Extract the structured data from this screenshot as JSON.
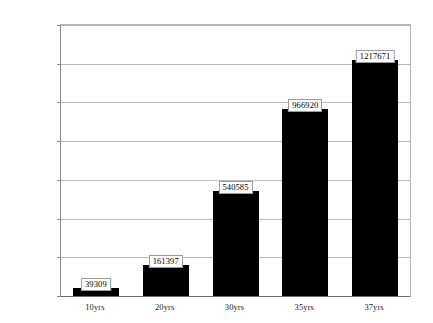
{
  "chart_data": {
    "type": "bar",
    "title": "",
    "subtitle": "",
    "xlabel": "",
    "ylabel": "",
    "categories": [
      "10yrs",
      "20yrs",
      "30yrs",
      "35yrs",
      "37yrs"
    ],
    "values": [
      39309,
      161397,
      540585,
      966920,
      1217671
    ],
    "data_labels": [
      "39309",
      "161397",
      "540585",
      "966920",
      "1217671"
    ],
    "ylim": [
      0,
      1400000
    ],
    "yticks": [
      0,
      200000,
      400000,
      600000,
      800000,
      1000000,
      1200000,
      1400000
    ],
    "ytick_labels": [
      "0",
      "200000",
      "400000",
      "600000",
      "800000",
      "1000000",
      "1200000",
      "1400000"
    ],
    "grid": true,
    "legend": false,
    "legend_position": "none",
    "series": [
      {
        "name": "",
        "values": [
          39309,
          161397,
          540585,
          966920,
          1217671
        ],
        "color": "#000000"
      }
    ],
    "colors": {
      "bar": "#000000",
      "gridline": "#b9b9b9",
      "axis": "#6b6b6b",
      "plot_background": "#ffffff",
      "label_border": "#9a9a9a",
      "label_background": "#ffffff",
      "text": "#1a1a1a"
    }
  }
}
